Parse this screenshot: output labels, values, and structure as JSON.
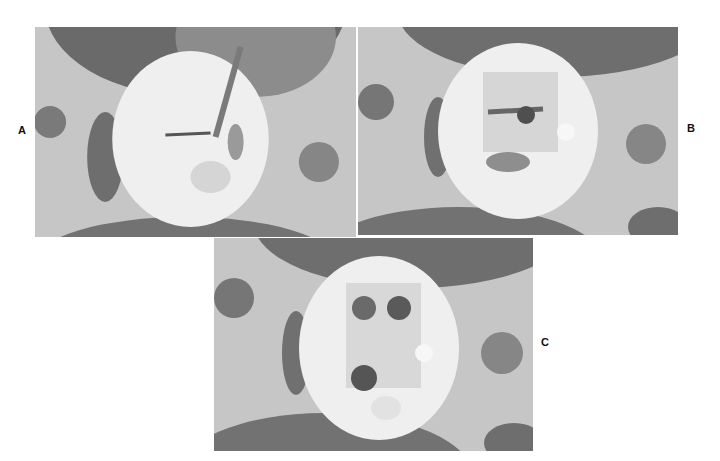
{
  "figure": {
    "panels": [
      {
        "id": "A",
        "label": "A",
        "description": "Endodontic access on a tooth model with instrument inserted"
      },
      {
        "id": "B",
        "label": "B",
        "description": "Tooth model showing access cavity with canal orifices"
      },
      {
        "id": "C",
        "label": "C",
        "description": "Tooth model showing prepared access cavity with canal orifices"
      }
    ],
    "colors": {
      "background": "#ffffff",
      "holder": "#c8c8c8",
      "dark_mold": "#6e6e6e",
      "tooth": "#efefef"
    }
  }
}
